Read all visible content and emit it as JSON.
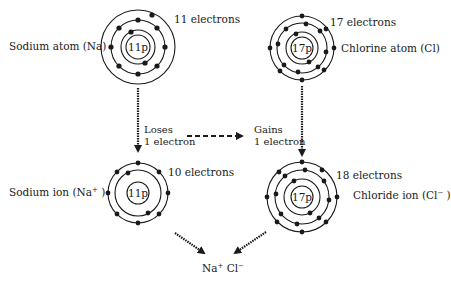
{
  "atoms": {
    "sodium_atom": {
      "label": "Sodium atom (Na)",
      "nucleus": "11p",
      "electrons_label": "11 electrons",
      "shells": [
        2,
        8,
        1
      ]
    },
    "chlorine_atom": {
      "label": "Chlorine atom (Cl)",
      "nucleus": "17p",
      "electrons_label": "17 electrons",
      "shells": [
        2,
        8,
        7
      ]
    },
    "sodium_ion": {
      "label_prefix": "Sodium ion  (Na",
      "label_sup": "+",
      "label_suffix": " )",
      "nucleus": "11p",
      "electrons_label": "10 electrons",
      "shells": [
        2,
        8
      ]
    },
    "chloride_ion": {
      "label_prefix": "Chloride ion (Cl",
      "label_sup": "−",
      "label_suffix": " )",
      "nucleus": "17p",
      "electrons_label": "18 electrons",
      "shells": [
        2,
        8,
        8
      ]
    }
  },
  "transfer": {
    "loses_line1": "Loses",
    "loses_line2": "1 electron",
    "gains_line1": "Gains",
    "gains_line2": "1 electron"
  },
  "product": {
    "na": "Na",
    "na_sup": "+",
    "cl": " Cl",
    "cl_sup": "−"
  },
  "colors": {
    "line": "#1a1a1a",
    "background": "#ffffff"
  }
}
